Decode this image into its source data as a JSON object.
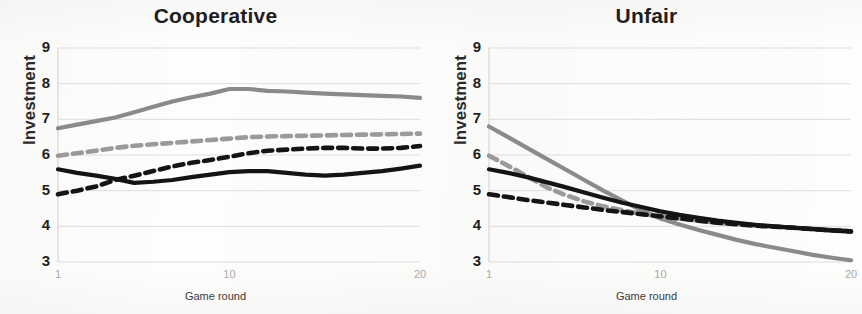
{
  "figure": {
    "background_color": "#fdfdfb",
    "panel_count": 2
  },
  "chart_data": [
    {
      "type": "line",
      "title": "Cooperative",
      "xlabel": "Game round",
      "ylabel": "Investment",
      "xlim": [
        1,
        20
      ],
      "ylim": [
        3,
        9
      ],
      "ytick_labels": [
        "9",
        "8",
        "7",
        "6",
        "5",
        "4",
        "3"
      ],
      "ytick_values": [
        9,
        8,
        7,
        6,
        5,
        4,
        3
      ],
      "xtick_labels": [
        "1",
        "10",
        "20"
      ],
      "xtick_values": [
        1,
        10,
        20
      ],
      "grid": "horizontal",
      "legend": "none",
      "x": [
        1,
        2,
        3,
        4,
        5,
        6,
        7,
        8,
        9,
        10,
        11,
        12,
        13,
        14,
        15,
        16,
        17,
        18,
        19,
        20
      ],
      "series": [
        {
          "name": "gray-solid",
          "color": "#8a8a8a",
          "style": "solid",
          "values": [
            6.75,
            6.85,
            6.95,
            7.05,
            7.2,
            7.35,
            7.5,
            7.62,
            7.72,
            7.85,
            7.85,
            7.8,
            7.78,
            7.75,
            7.72,
            7.7,
            7.68,
            7.66,
            7.64,
            7.6
          ]
        },
        {
          "name": "gray-dashed",
          "color": "#9a9a9a",
          "style": "dashed",
          "values": [
            5.98,
            6.05,
            6.12,
            6.2,
            6.26,
            6.3,
            6.34,
            6.38,
            6.42,
            6.46,
            6.5,
            6.52,
            6.53,
            6.54,
            6.55,
            6.56,
            6.57,
            6.58,
            6.59,
            6.6
          ]
        },
        {
          "name": "black-solid",
          "color": "#141414",
          "style": "solid",
          "values": [
            5.6,
            5.5,
            5.42,
            5.33,
            5.22,
            5.25,
            5.3,
            5.38,
            5.45,
            5.52,
            5.55,
            5.55,
            5.5,
            5.45,
            5.42,
            5.45,
            5.5,
            5.55,
            5.62,
            5.7
          ]
        },
        {
          "name": "black-dashed",
          "color": "#141414",
          "style": "dashed",
          "values": [
            4.9,
            5.0,
            5.12,
            5.3,
            5.42,
            5.55,
            5.68,
            5.78,
            5.86,
            5.95,
            6.05,
            6.12,
            6.15,
            6.18,
            6.2,
            6.2,
            6.18,
            6.18,
            6.2,
            6.25
          ]
        }
      ]
    },
    {
      "type": "line",
      "title": "Unfair",
      "xlabel": "Game round",
      "ylabel": "Investment",
      "xlim": [
        1,
        20
      ],
      "ylim": [
        3,
        9
      ],
      "ytick_labels": [
        "9",
        "8",
        "7",
        "6",
        "5",
        "4",
        "3"
      ],
      "ytick_values": [
        9,
        8,
        7,
        6,
        5,
        4,
        3
      ],
      "xtick_labels": [
        "1",
        "10",
        "20"
      ],
      "xtick_values": [
        1,
        10,
        20
      ],
      "grid": "horizontal",
      "legend": "none",
      "x": [
        1,
        2,
        3,
        4,
        5,
        6,
        7,
        8,
        9,
        10,
        11,
        12,
        13,
        14,
        15,
        16,
        17,
        18,
        19,
        20
      ],
      "series": [
        {
          "name": "gray-solid",
          "color": "#8a8a8a",
          "style": "solid",
          "values": [
            6.8,
            6.5,
            6.2,
            5.9,
            5.6,
            5.3,
            5.0,
            4.72,
            4.45,
            4.22,
            4.05,
            3.9,
            3.76,
            3.62,
            3.5,
            3.4,
            3.3,
            3.2,
            3.12,
            3.05
          ]
        },
        {
          "name": "gray-dashed",
          "color": "#9a9a9a",
          "style": "dashed",
          "values": [
            5.98,
            5.7,
            5.4,
            5.1,
            4.88,
            4.7,
            4.56,
            4.45,
            4.35,
            4.28,
            4.22,
            4.16,
            4.1,
            4.06,
            4.02,
            3.99,
            3.96,
            3.93,
            3.9,
            3.88
          ]
        },
        {
          "name": "black-solid",
          "color": "#141414",
          "style": "solid",
          "values": [
            5.6,
            5.5,
            5.38,
            5.24,
            5.1,
            4.95,
            4.8,
            4.66,
            4.54,
            4.42,
            4.32,
            4.24,
            4.16,
            4.1,
            4.04,
            4.0,
            3.96,
            3.92,
            3.88,
            3.85
          ]
        },
        {
          "name": "black-dashed",
          "color": "#141414",
          "style": "dashed",
          "values": [
            4.9,
            4.82,
            4.74,
            4.67,
            4.6,
            4.53,
            4.46,
            4.4,
            4.34,
            4.28,
            4.22,
            4.16,
            4.1,
            4.06,
            4.02,
            3.99,
            3.96,
            3.92,
            3.89,
            3.86
          ]
        }
      ]
    }
  ]
}
